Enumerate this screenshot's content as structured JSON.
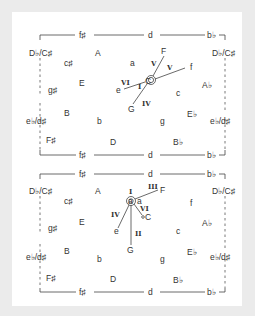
{
  "panels": [
    {
      "id": "top",
      "frame": {
        "top_labels": [
          "f♯",
          "d",
          "b♭"
        ],
        "bottom_labels": [
          "f♯",
          "d",
          "b♭"
        ],
        "side_left": [
          "D♭/C♯",
          "e♭/d♯"
        ],
        "side_right": [
          "D♭/C♯",
          "e♭/d♯"
        ]
      },
      "grid_labels": [
        "A",
        "c♯",
        "E",
        "g♯",
        "B",
        "F♯",
        "b",
        "D",
        "a",
        "c",
        "A♭",
        "E♭",
        "g",
        "B♭",
        "f"
      ],
      "center_label": "C",
      "vectors": [
        {
          "roman": "V",
          "target": "F"
        },
        {
          "roman": "V",
          "target": "f"
        },
        {
          "roman": "VI",
          "target": "e"
        },
        {
          "roman": "IV",
          "target": "G"
        },
        {
          "roman": "I",
          "target": "C"
        }
      ]
    },
    {
      "id": "bottom",
      "frame": {
        "top_labels": [
          "f♯",
          "d",
          "b♭"
        ],
        "bottom_labels": [
          "f♯",
          "d",
          "b♭"
        ],
        "side_left": [
          "D♭/C♯",
          "e♭/d♯"
        ],
        "side_right": [
          "D♭/C♯",
          "e♭/d♯"
        ]
      },
      "grid_labels": [
        "A",
        "c♯",
        "E",
        "g♯",
        "B",
        "F♯",
        "b",
        "D",
        "f",
        "A♭",
        "c",
        "E♭",
        "g",
        "B♭"
      ],
      "center_label": "a",
      "vectors": [
        {
          "roman": "I",
          "target": "a"
        },
        {
          "roman": "III",
          "target": "F"
        },
        {
          "roman": "VI",
          "target": "C"
        },
        {
          "roman": "IV",
          "target": "e"
        },
        {
          "roman": "II",
          "target": "G"
        }
      ]
    }
  ]
}
